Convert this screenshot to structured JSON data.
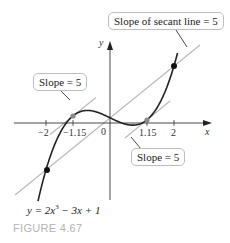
{
  "figure": {
    "caption": "FIGURE 4.67",
    "equation_label": "y = 2x",
    "equation_exp": "3",
    "equation_rest": " − 3x + 1",
    "callouts": {
      "secant": "Slope of secant line = 5",
      "tangent_left": "Slope = 5",
      "tangent_right": "Slope = 5"
    },
    "axes": {
      "x_label": "x",
      "y_label": "y",
      "ticks": [
        "−2",
        "−1.15",
        "0",
        "1.15",
        "2"
      ]
    },
    "colors": {
      "curve": "#222222",
      "tangent_lines": "#b8b8b8",
      "secant_line": "#b8b8b8",
      "tangent_points": "#8a8a8a",
      "secant_points": "#111111",
      "caption": "#b3b3b3"
    }
  },
  "chart_data": {
    "type": "line",
    "title": "FIGURE 4.67",
    "function": "y = 2x^3 - 3x + 1",
    "xlabel": "x",
    "ylabel": "y",
    "xticks": [
      -2,
      -1.15,
      0,
      1.15,
      2
    ],
    "secant_points": [
      [
        -2,
        -9
      ],
      [
        2,
        11
      ]
    ],
    "secant_slope": 5,
    "tangent_points": [
      [
        -1.15,
        1.41
      ],
      [
        1.15,
        0.59
      ]
    ],
    "tangent_slope": 5,
    "annotations": [
      "Slope of secant line = 5",
      "Slope = 5",
      "Slope = 5"
    ]
  }
}
